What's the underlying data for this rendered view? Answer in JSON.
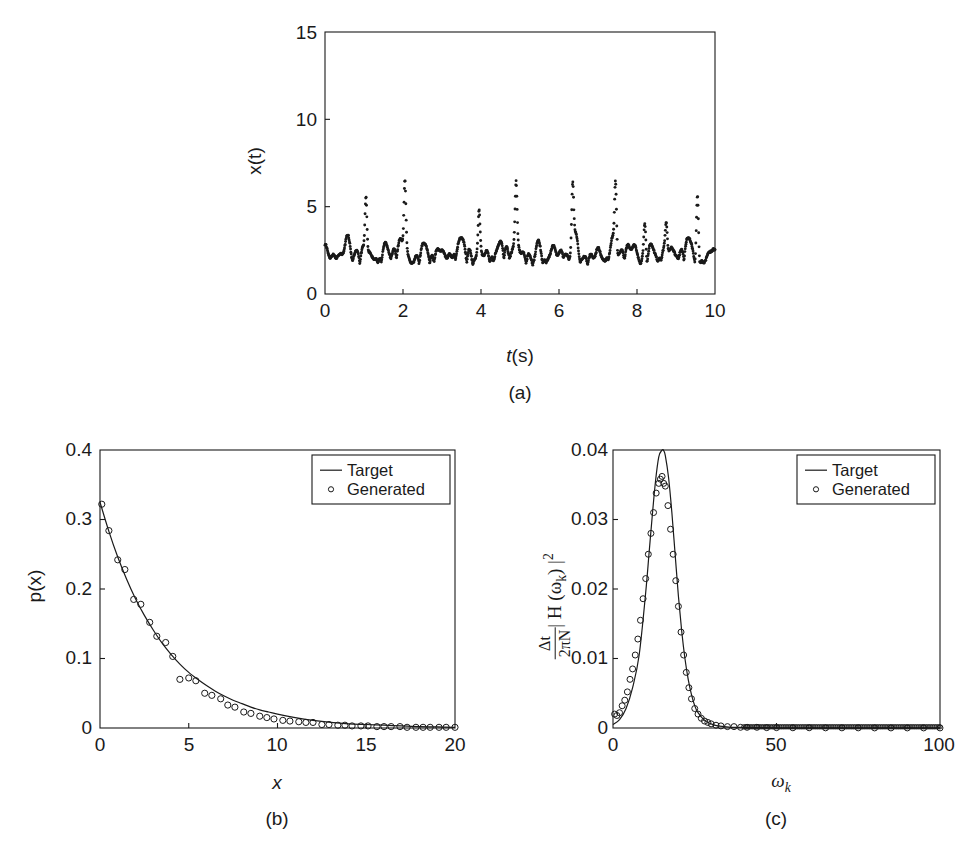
{
  "figure": {
    "background": "#ffffff",
    "axis_color": "#1a1a1a",
    "marker_color": "#1a1a1a",
    "line_color": "#1a1a1a"
  },
  "panels": {
    "a": {
      "caption": "(a)",
      "xlabel_italic": "t",
      "xlabel_rest": "(s)",
      "ylabel_italic": "x",
      "ylabel_rest": "(t)",
      "xticks": [
        "0",
        "2",
        "4",
        "6",
        "8",
        "10"
      ],
      "yticks": [
        "0",
        "5",
        "10",
        "15"
      ]
    },
    "b": {
      "caption": "(b)",
      "xlabel_italic": "x",
      "ylabel_italic": "p",
      "ylabel_rest": "(x)",
      "xticks": [
        "0",
        "5",
        "10",
        "15",
        "20"
      ],
      "yticks": [
        "0",
        "0.1",
        "0.2",
        "0.3",
        "0.4"
      ],
      "legend": [
        "Target",
        "Generated"
      ]
    },
    "c": {
      "caption": "(c)",
      "xlabel_main": "ω",
      "xlabel_sub": "k",
      "ylabel_num": "Δt",
      "ylabel_den": "2πN",
      "ylabel_rest": "| H (ω",
      "ylabel_rest_sub": "k",
      "ylabel_rest2": ") |",
      "ylabel_rest_sup": "2",
      "xticks": [
        "0",
        "50",
        "100"
      ],
      "yticks": [
        "0",
        "0.01",
        "0.02",
        "0.03",
        "0.04"
      ],
      "legend": [
        "Target",
        "Generated"
      ]
    }
  },
  "chart_data": [
    {
      "id": "panel-a",
      "type": "line",
      "title": "",
      "xlabel": "t(s)",
      "ylabel": "x(t)",
      "xlim": [
        0,
        10
      ],
      "ylim": [
        0,
        15
      ],
      "xticks": [
        0,
        2,
        4,
        6,
        8,
        10
      ],
      "yticks": [
        0,
        5,
        10,
        15
      ],
      "grid": false,
      "legend": null,
      "series": [
        {
          "name": "x(t)",
          "style": "dotted-markers",
          "note": "Dense dot-marker trace; baseline oscillation about 1.8-3.8 with sharp spikes reaching 4.5-6.8",
          "baseline_mean": 2.5,
          "baseline_min": 1.75,
          "baseline_max": 3.9,
          "spikes": [
            {
              "t": 1.05,
              "value": 6.1
            },
            {
              "t": 2.05,
              "value": 6.7
            },
            {
              "t": 3.95,
              "value": 5.25
            },
            {
              "t": 4.9,
              "value": 6.3
            },
            {
              "t": 6.35,
              "value": 6.5
            },
            {
              "t": 7.45,
              "value": 6.75
            },
            {
              "t": 8.2,
              "value": 4.6
            },
            {
              "t": 8.75,
              "value": 4.45
            },
            {
              "t": 9.55,
              "value": 6.35
            }
          ]
        }
      ]
    },
    {
      "id": "panel-b",
      "type": "line",
      "title": "",
      "xlabel": "x",
      "ylabel": "p(x)",
      "xlim": [
        0,
        20
      ],
      "ylim": [
        0,
        0.4
      ],
      "xticks": [
        0,
        5,
        10,
        15,
        20
      ],
      "yticks": [
        0,
        0.1,
        0.2,
        0.3,
        0.4
      ],
      "grid": false,
      "legend_position": "top-right",
      "series": [
        {
          "name": "Target",
          "style": "solid-line",
          "x": [
            0,
            0.5,
            1,
            1.5,
            2,
            2.5,
            3,
            3.5,
            4,
            4.5,
            5,
            5.5,
            6,
            6.5,
            7,
            7.5,
            8,
            8.5,
            9,
            9.5,
            10,
            11,
            12,
            13,
            14,
            15,
            16,
            17,
            18,
            19,
            20
          ],
          "y": [
            0.325,
            0.283,
            0.246,
            0.214,
            0.186,
            0.162,
            0.141,
            0.122,
            0.106,
            0.092,
            0.08,
            0.07,
            0.061,
            0.053,
            0.046,
            0.04,
            0.035,
            0.03,
            0.026,
            0.023,
            0.02,
            0.015,
            0.011,
            0.008,
            0.006,
            0.005,
            0.004,
            0.003,
            0.002,
            0.0015,
            0.001
          ]
        },
        {
          "name": "Generated",
          "style": "open-circles",
          "x": [
            0.1,
            0.5,
            1.0,
            1.4,
            1.9,
            2.3,
            2.8,
            3.2,
            3.7,
            4.1,
            4.5,
            5.0,
            5.4,
            5.9,
            6.3,
            6.8,
            7.2,
            7.6,
            8.1,
            8.5,
            9.0,
            9.4,
            9.8,
            10.3,
            10.7,
            11.2,
            11.6,
            12.0,
            12.5,
            12.9,
            13.4,
            13.8,
            14.2,
            14.7,
            15.1,
            15.6,
            16.0,
            16.4,
            16.9,
            17.3,
            17.8,
            18.2,
            18.6,
            19.1,
            19.5,
            20.0
          ],
          "y": [
            0.322,
            0.284,
            0.242,
            0.228,
            0.185,
            0.178,
            0.152,
            0.132,
            0.123,
            0.103,
            0.07,
            0.072,
            0.068,
            0.05,
            0.047,
            0.042,
            0.033,
            0.03,
            0.023,
            0.021,
            0.017,
            0.015,
            0.013,
            0.011,
            0.01,
            0.009,
            0.008,
            0.008,
            0.005,
            0.005,
            0.004,
            0.004,
            0.003,
            0.003,
            0.003,
            0.002,
            0.002,
            0.002,
            0.002,
            0.001,
            0.001,
            0.001,
            0.001,
            0.001,
            0.001,
            0.001
          ]
        }
      ]
    },
    {
      "id": "panel-c",
      "type": "line",
      "title": "",
      "xlabel": "ω_k",
      "ylabel": "(Δt / 2πN) |H(ω_k)|^2",
      "xlim": [
        0,
        100
      ],
      "ylim": [
        0,
        0.04
      ],
      "xticks": [
        0,
        50,
        100
      ],
      "yticks": [
        0,
        0.01,
        0.02,
        0.03,
        0.04
      ],
      "grid": false,
      "legend_position": "top-right",
      "series": [
        {
          "name": "Target",
          "style": "solid-line",
          "x": [
            0,
            2,
            4,
            6,
            8,
            10,
            11,
            12,
            13,
            14,
            15,
            15.5,
            16,
            17,
            18,
            19,
            20,
            21,
            22,
            23,
            24,
            25,
            26,
            28,
            30,
            32,
            34,
            36,
            38,
            40,
            45,
            50,
            60,
            70,
            80,
            90,
            100
          ],
          "y": [
            0.0005,
            0.0012,
            0.0028,
            0.0058,
            0.0105,
            0.0195,
            0.025,
            0.0305,
            0.0355,
            0.039,
            0.04,
            0.0399,
            0.0392,
            0.036,
            0.031,
            0.025,
            0.019,
            0.014,
            0.01,
            0.007,
            0.0048,
            0.0032,
            0.0022,
            0.0011,
            0.0006,
            0.0003,
            0.0002,
            0.0001,
            0.0001,
            0.0001,
            5e-05,
            2e-05,
            1e-05,
            1e-05,
            1e-05,
            1e-05,
            1e-05
          ]
        },
        {
          "name": "Generated",
          "style": "open-circles",
          "x": [
            0.5,
            1.2,
            2.0,
            2.8,
            3.6,
            4.4,
            5.2,
            6.0,
            6.8,
            7.6,
            8.4,
            9.2,
            10.0,
            10.8,
            11.6,
            12.4,
            13.2,
            14.0,
            14.5,
            15.0,
            15.5,
            16.0,
            16.8,
            17.6,
            18.4,
            19.2,
            20.0,
            20.8,
            21.6,
            22.4,
            23.2,
            24.0,
            25.0,
            26.0,
            27.0,
            28.0,
            29.0,
            30.0,
            31.5,
            33.0,
            35.0,
            37.0,
            39.0,
            41.0,
            44.0,
            47.0,
            50.0,
            55.0,
            60.0,
            65.0,
            70.0,
            75.0,
            80.0,
            85.0,
            90.0,
            95.0,
            100.0
          ],
          "y": [
            0.002,
            0.0018,
            0.0022,
            0.0032,
            0.004,
            0.0052,
            0.007,
            0.0085,
            0.0105,
            0.0128,
            0.0155,
            0.0186,
            0.0215,
            0.025,
            0.028,
            0.031,
            0.0338,
            0.0352,
            0.0358,
            0.0362,
            0.0352,
            0.0348,
            0.032,
            0.0286,
            0.025,
            0.0212,
            0.0175,
            0.0138,
            0.0105,
            0.008,
            0.0058,
            0.0042,
            0.0028,
            0.002,
            0.0014,
            0.001,
            0.0008,
            0.0006,
            0.0004,
            0.0003,
            0.0002,
            0.0002,
            0.0001,
            0.0001,
            0.0001,
            5e-05,
            5e-05,
            3e-05,
            3e-05,
            2e-05,
            2e-05,
            2e-05,
            1e-05,
            1e-05,
            1e-05,
            1e-05,
            1e-05
          ]
        }
      ]
    }
  ]
}
